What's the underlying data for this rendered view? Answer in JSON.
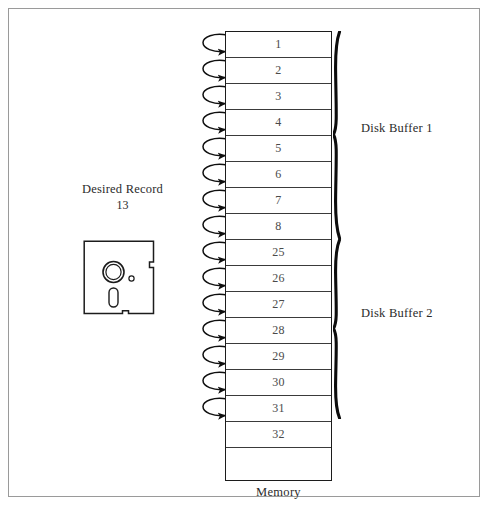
{
  "figure": {
    "desired_record": {
      "title": "Desired Record",
      "number": "13"
    },
    "memory": {
      "caption": "Memory",
      "rows": [
        "1",
        "2",
        "3",
        "4",
        "5",
        "6",
        "7",
        "8",
        "25",
        "26",
        "27",
        "28",
        "29",
        "30",
        "31",
        "32"
      ]
    },
    "buffers": [
      {
        "label": "Disk Buffer 1",
        "rows": [
          "1",
          "2",
          "3",
          "4",
          "5",
          "6",
          "7",
          "8"
        ]
      },
      {
        "label": "Disk Buffer 2",
        "rows": [
          "25",
          "26",
          "27",
          "28",
          "29",
          "30",
          "31",
          "32"
        ]
      }
    ],
    "icons": {
      "floppy": "floppy-disk-icon",
      "hook_arrow": "curved-arrow-icon",
      "brace": "curly-brace-icon"
    },
    "colors": {
      "frame": "#9a9a9a",
      "ink": "#1c1c1c",
      "row_rule": "#3a3a3a",
      "text": "#2b2b2b",
      "row_text": "#4a4a4a"
    }
  }
}
